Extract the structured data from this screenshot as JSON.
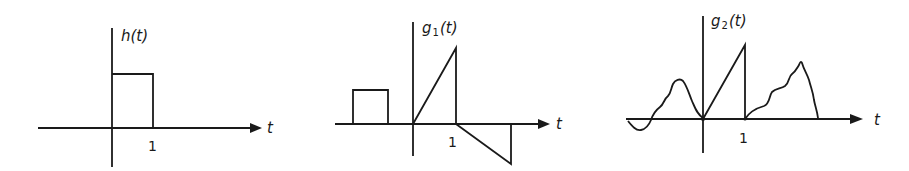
{
  "figure": {
    "panels": [
      {
        "id": "h",
        "title_base": "h",
        "title_sub": "",
        "title_arg": "(t)",
        "x_axis_label": "t",
        "tick_label": "1",
        "description": "Rectangular pulse of height 1 from t=0 to t=1"
      },
      {
        "id": "g1",
        "title_base": "g",
        "title_sub": "1",
        "title_arg": "(t)",
        "x_axis_label": "t",
        "tick_label": "1",
        "description": "Rectangular pulse at negative t, ramp rising from 0 to 1 then dropping, then a negative ramp returning to zero"
      },
      {
        "id": "g2",
        "title_base": "g",
        "title_sub": "2",
        "title_arg": "(t)",
        "x_axis_label": "t",
        "tick_label": "1",
        "description": "Arbitrary wavy signal for t<0, ramp from 0 to 1 then drop, arbitrary wavy bump for t>1"
      }
    ],
    "colors": {
      "ink": "#1a1a1a",
      "background": "#ffffff"
    }
  }
}
